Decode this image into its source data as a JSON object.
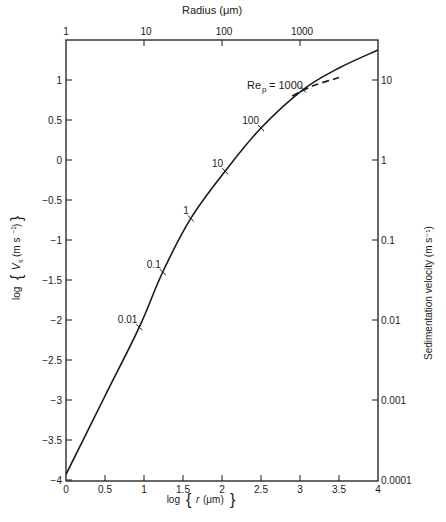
{
  "chart_data": {
    "type": "line",
    "title": "",
    "xlabel": "log {r (μm)}",
    "ylabel": "log {Vs (m s⁻¹)}",
    "x2label": "Radius (μm)",
    "y2label": "Sedimentation velocity (m s⁻¹)",
    "xlim": [
      0,
      4
    ],
    "ylim": [
      -4,
      1.5
    ],
    "grid": false,
    "legend": "none",
    "x_ticks": [
      "0",
      "0.5",
      "1",
      "1.5",
      "2",
      "2.5",
      "3",
      "3.5",
      "4"
    ],
    "y_ticks": [
      "-4",
      "-3.5",
      "-3",
      "-2.5",
      "-2",
      "-1.5",
      "-1",
      "-0.5",
      "0",
      "0.5",
      "1"
    ],
    "x2_ticks": [
      "1",
      "10",
      "100",
      "1000"
    ],
    "y2_ticks": [
      "0.0001",
      "0.001",
      "0.01",
      "0.1",
      "1",
      "10"
    ],
    "series": [
      {
        "name": "Sedimentation velocity",
        "style": "solid",
        "x": [
          0,
          0.5,
          0.94,
          1.24,
          1.6,
          2.04,
          2.5,
          3.04,
          3.5,
          4.0
        ],
        "y": [
          -3.93,
          -2.95,
          -2.09,
          -1.4,
          -0.73,
          -0.14,
          0.4,
          0.88,
          1.15,
          1.375
        ]
      },
      {
        "name": "Rep = 1000 (dashed)",
        "style": "dashed",
        "x": [
          2.9,
          3.04,
          3.2,
          3.5
        ],
        "y": [
          0.8,
          0.87,
          0.94,
          1.03
        ]
      }
    ],
    "annotations": [
      {
        "text": "0.01",
        "x": 0.94,
        "y": -2.09
      },
      {
        "text": "0.1",
        "x": 1.24,
        "y": -1.4
      },
      {
        "text": "1",
        "x": 1.6,
        "y": -0.73
      },
      {
        "text": "10",
        "x": 2.04,
        "y": -0.14
      },
      {
        "text": "100",
        "x": 2.5,
        "y": 0.4
      },
      {
        "text": "Rep = 1000",
        "x": 3.04,
        "y": 0.88
      }
    ]
  },
  "labels": {
    "top_axis": "Radius (μm)",
    "right_axis": "Sedimentation velocity (m s⁻¹)",
    "left_axis_log": "log",
    "left_axis_var": "Vs (m s⁻¹)",
    "bottom_axis_log": "log",
    "bottom_axis_var": "r (μm)",
    "rep_label": "Re",
    "rep_sub": "p",
    "rep_value": "= 1000"
  }
}
